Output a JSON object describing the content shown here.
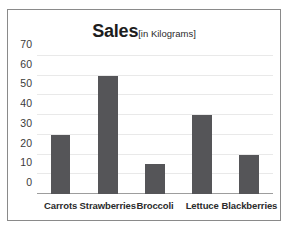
{
  "chart_data": {
    "type": "bar",
    "title": "Sales",
    "subtitle": "[in Kilograms]",
    "xlabel": "",
    "ylabel": "",
    "categories": [
      "Carrots",
      "Strawberries",
      "Broccoli",
      "Lettuce",
      "Blackberries"
    ],
    "values": [
      30,
      60,
      15,
      40,
      20
    ],
    "ylim": [
      0,
      70
    ],
    "yticks": [
      0,
      10,
      20,
      30,
      40,
      50,
      60,
      70
    ],
    "ytick_labels": [
      "0",
      "10",
      "20",
      "30",
      "40",
      "50",
      "60",
      "70"
    ],
    "grid": "horizontal",
    "legend": "none",
    "colors": {
      "bar": "#555558",
      "gridline": "#e9e9e9",
      "axis": "#9d9d9d",
      "border": "#8a8a8a",
      "background": "#ffffff",
      "text": "#2b2b2b"
    }
  }
}
